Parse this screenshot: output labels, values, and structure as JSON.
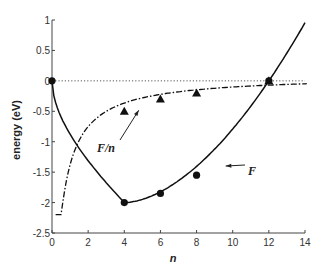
{
  "chart_data": {
    "type": "line",
    "title": "",
    "xlabel": "n",
    "ylabel": "energy (eV)",
    "xlim": [
      0,
      14
    ],
    "ylim": [
      -2.5,
      1
    ],
    "xticks": [
      "0",
      "2",
      "4",
      "6",
      "8",
      "10",
      "12",
      "14"
    ],
    "yticks": [
      "1",
      "0.5",
      "0",
      "-0.5",
      "-1",
      "-1.5",
      "-2",
      "-2.5"
    ],
    "grid": false,
    "series": [
      {
        "name": "F",
        "style": "solid line with circle markers",
        "marker_x": [
          0,
          4,
          6,
          8,
          12
        ],
        "marker_y": [
          0,
          -2.0,
          -1.85,
          -1.55,
          0
        ]
      },
      {
        "name": "F/n",
        "style": "dash-dot line with triangle markers",
        "marker_x": [
          4,
          6,
          8,
          12
        ],
        "marker_y": [
          -0.5,
          -0.3,
          -0.2,
          0
        ]
      },
      {
        "name": "zero reference",
        "style": "dotted horizontal line",
        "y": 0
      }
    ],
    "annotations": [
      {
        "text": "F/n",
        "arrow_to": [
          4.8,
          -0.45
        ]
      },
      {
        "text": "F",
        "arrow_to": [
          9.5,
          -1.35
        ]
      }
    ]
  }
}
